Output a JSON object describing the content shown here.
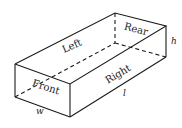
{
  "diagram": {
    "faces": {
      "left": "Left",
      "rear": "Rear",
      "right": "Right",
      "front": "Front"
    },
    "dimensions": {
      "height": "h",
      "length": "l",
      "width": "w"
    },
    "colors": {
      "line": "#1a1a1a",
      "background": "#ffffff"
    }
  }
}
